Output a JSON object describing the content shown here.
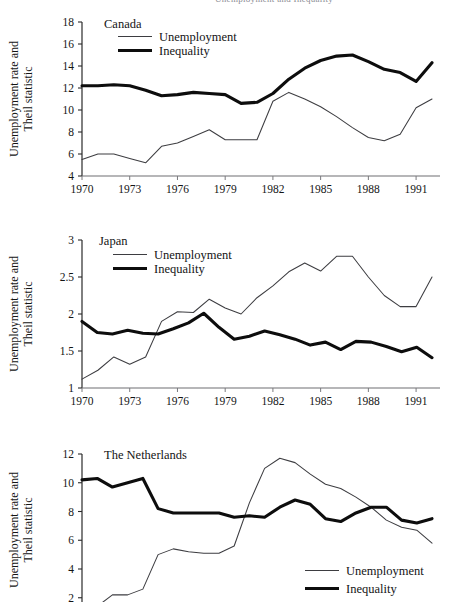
{
  "figure": {
    "cropped_header_text": "Unemployment and Inequality",
    "shared_ylabel_line1": "Unemployment rate and",
    "shared_ylabel_line2": "Theil statistic",
    "legend": {
      "unemployment_label": "Unemployment",
      "inequality_label": "Inequality"
    },
    "colors": {
      "unemployment": "#3d3d41",
      "inequality": "#0d0d0d",
      "axis": "#6f6f73",
      "text": "#141414",
      "background": "#ffffff"
    }
  },
  "chart_data": [
    {
      "type": "line",
      "title": "Canada",
      "xlabel": "",
      "ylabel": "Unemployment rate and Theil statistic",
      "xlim": [
        1970,
        1992
      ],
      "ylim": [
        4,
        18
      ],
      "yticks": [
        4,
        6,
        8,
        10,
        12,
        14,
        16,
        18
      ],
      "xticks": [
        1970,
        1973,
        1976,
        1979,
        1982,
        1985,
        1988,
        1991
      ],
      "xtick_labels": [
        "1970",
        "1973",
        "1976",
        "1979",
        "1982",
        "1985",
        "1988",
        "1991"
      ],
      "ytick_labels": [
        "4",
        "6",
        "8",
        "10",
        "12",
        "14",
        "16",
        "18"
      ],
      "grid": false,
      "legend_position": "top-left",
      "x": [
        1970,
        1971,
        1972,
        1973,
        1974,
        1975,
        1976,
        1977,
        1978,
        1979,
        1980,
        1981,
        1982,
        1983,
        1984,
        1985,
        1986,
        1987,
        1988,
        1989,
        1990,
        1991,
        1992
      ],
      "series": [
        {
          "name": "Unemployment",
          "values": [
            5.5,
            6.0,
            6.0,
            5.6,
            5.2,
            6.7,
            7.0,
            7.6,
            8.2,
            7.3,
            7.3,
            7.3,
            10.8,
            11.6,
            11.0,
            10.3,
            9.4,
            8.4,
            7.5,
            7.2,
            7.8,
            10.2,
            11.0
          ]
        },
        {
          "name": "Inequality",
          "values": [
            12.2,
            12.2,
            12.3,
            12.2,
            11.8,
            11.3,
            11.4,
            11.6,
            11.5,
            11.4,
            10.6,
            10.7,
            11.5,
            12.8,
            13.8,
            14.5,
            14.9,
            15.0,
            14.4,
            13.7,
            13.4,
            12.6,
            14.3
          ]
        }
      ]
    },
    {
      "type": "line",
      "title": "Japan",
      "xlabel": "",
      "ylabel": "Unemployment rate and Theil statistic",
      "xlim": [
        1970,
        1992
      ],
      "ylim": [
        1,
        3
      ],
      "yticks": [
        1,
        1.5,
        2,
        2.5,
        3
      ],
      "xticks": [
        1970,
        1973,
        1976,
        1979,
        1982,
        1985,
        1988,
        1991
      ],
      "xtick_labels": [
        "1970",
        "1973",
        "1976",
        "1979",
        "1982",
        "1985",
        "1988",
        "1991"
      ],
      "ytick_labels": [
        "1",
        "1.5",
        "2",
        "2.5",
        "3"
      ],
      "grid": false,
      "legend_position": "top-left",
      "x": [
        1970,
        1971,
        1972,
        1973,
        1974,
        1975,
        1976,
        1977,
        1978,
        1979,
        1980,
        1981,
        1982,
        1983,
        1984,
        1985,
        1986,
        1987,
        1988,
        1989,
        1990,
        1991,
        1992
      ],
      "series": [
        {
          "name": "Unemployment",
          "values": [
            1.12,
            1.24,
            1.42,
            1.32,
            1.42,
            1.9,
            2.03,
            2.02,
            2.2,
            2.08,
            2.0,
            2.22,
            2.38,
            2.57,
            2.69,
            2.58,
            2.78,
            2.78,
            2.5,
            2.25,
            2.1,
            2.1,
            2.5
          ]
        },
        {
          "name": "Inequality",
          "values": [
            1.9,
            1.75,
            1.73,
            1.78,
            1.74,
            1.73,
            1.8,
            1.88,
            2.01,
            1.82,
            1.66,
            1.7,
            1.77,
            1.72,
            1.66,
            1.58,
            1.62,
            1.52,
            1.63,
            1.62,
            1.56,
            1.49,
            1.55,
            1.41
          ]
        }
      ]
    },
    {
      "type": "line",
      "title": "The Netherlands",
      "xlabel": "",
      "ylabel": "Unemployment rate and Theil statistic",
      "xlim": [
        1970,
        1992
      ],
      "ylim": [
        0.8,
        12
      ],
      "yticks": [
        2,
        4,
        6,
        8,
        10,
        12
      ],
      "xticks": [
        1970,
        1973,
        1976,
        1979,
        1982,
        1985,
        1988,
        1991
      ],
      "xtick_labels": [
        "1970",
        "1973",
        "1976",
        "1979",
        "1982",
        "1985",
        "1988",
        "1991"
      ],
      "ytick_labels": [
        "2",
        "4",
        "6",
        "8",
        "10",
        "12"
      ],
      "grid": false,
      "legend_position": "bottom-right",
      "x": [
        1970,
        1971,
        1972,
        1973,
        1974,
        1975,
        1976,
        1977,
        1978,
        1979,
        1980,
        1981,
        1982,
        1983,
        1984,
        1985,
        1986,
        1987,
        1988,
        1989,
        1990,
        1991,
        1992
      ],
      "series": [
        {
          "name": "Unemployment",
          "values": [
            1.0,
            1.4,
            2.2,
            2.2,
            2.6,
            5.0,
            5.4,
            5.2,
            5.1,
            5.1,
            5.6,
            8.6,
            11.0,
            11.7,
            11.4,
            10.6,
            9.9,
            9.6,
            9.0,
            8.3,
            7.4,
            6.9,
            6.7,
            5.8
          ]
        },
        {
          "name": "Inequality",
          "values": [
            10.2,
            10.3,
            9.7,
            10.0,
            10.3,
            8.2,
            7.9,
            7.9,
            7.9,
            7.9,
            7.6,
            7.7,
            7.6,
            8.3,
            8.8,
            8.5,
            7.5,
            7.3,
            7.9,
            8.3,
            8.3,
            7.4,
            7.2,
            7.5
          ]
        }
      ]
    }
  ]
}
